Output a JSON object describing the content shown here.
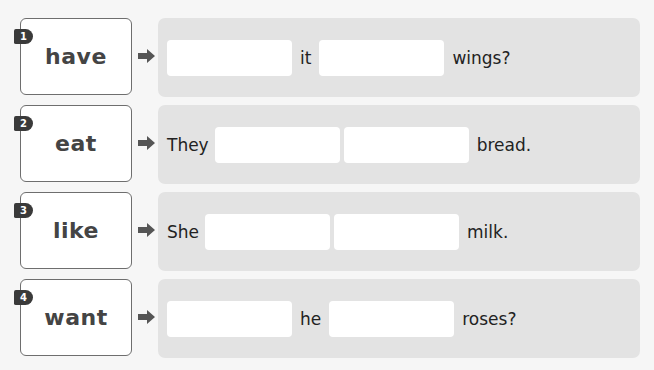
{
  "exercise": {
    "items": [
      {
        "number": "1",
        "word": "have",
        "sentence": {
          "lead": "",
          "middle": "it",
          "end": "wings?"
        }
      },
      {
        "number": "2",
        "word": "eat",
        "sentence": {
          "lead": "They",
          "middle": "",
          "end": "bread."
        }
      },
      {
        "number": "3",
        "word": "like",
        "sentence": {
          "lead": "She",
          "middle": "",
          "end": "milk."
        }
      },
      {
        "number": "4",
        "word": "want",
        "sentence": {
          "lead": "",
          "middle": "he",
          "end": "roses?"
        }
      }
    ],
    "icons": {
      "arrow": "arrow-right-icon"
    },
    "colors": {
      "panel": "#e3e3e3",
      "badge": "#3a3a3a",
      "card_border": "#6e6e6e",
      "word": "#444444"
    }
  }
}
